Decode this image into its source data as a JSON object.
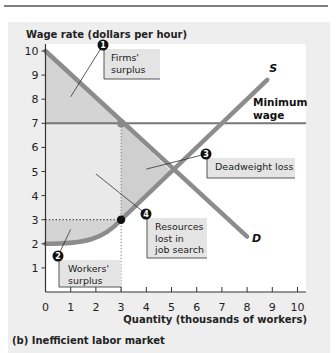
{
  "chart_data": {
    "type": "line",
    "panel_caption": "(b)  Inefficient labor market",
    "ylabel": "Wage rate (dollars per hour)",
    "xlabel": "Quantity (thousands of workers)",
    "xlim": [
      0,
      10
    ],
    "ylim": [
      0,
      10
    ],
    "x_ticks": [
      0,
      1,
      2,
      3,
      4,
      5,
      6,
      7,
      8,
      9,
      10
    ],
    "y_ticks": [
      1,
      2,
      3,
      4,
      5,
      6,
      7,
      8,
      9,
      10
    ],
    "highlight_x_tick": 3,
    "grid": false,
    "series": [
      {
        "name": "D",
        "label": "D",
        "kind": "demand",
        "points": [
          [
            0,
            10
          ],
          [
            8,
            2.3
          ]
        ]
      },
      {
        "name": "S",
        "label": "S",
        "kind": "supply",
        "points": [
          [
            0,
            2
          ],
          [
            1,
            2.05
          ],
          [
            2,
            2.4
          ],
          [
            3,
            3
          ],
          [
            5,
            5
          ],
          [
            8.8,
            8.8
          ]
        ]
      },
      {
        "name": "Minimum wage",
        "label": "Minimum\nwage",
        "kind": "horizontal",
        "y": 7,
        "x_range": [
          0,
          10.5
        ]
      }
    ],
    "points_of_interest": [
      {
        "name": "min-wage-demand",
        "x": 3,
        "y": 7,
        "color": "#8a8a8a"
      },
      {
        "name": "supply-at-3",
        "x": 3,
        "y": 3,
        "color": "#111111"
      },
      {
        "name": "equilibrium",
        "x": 5,
        "y": 5
      }
    ],
    "guides": [
      {
        "type": "vertical",
        "x": 3,
        "y_range": [
          0,
          7
        ]
      },
      {
        "type": "horizontal",
        "y": 3,
        "x_range": [
          0,
          3
        ]
      }
    ],
    "regions": [
      {
        "name": "firms-surplus",
        "polygon": [
          [
            0,
            10
          ],
          [
            3,
            7
          ],
          [
            0,
            7
          ]
        ]
      },
      {
        "name": "resources-lost-in-job-search",
        "polygon": [
          [
            0,
            7
          ],
          [
            3,
            7
          ],
          [
            3,
            3
          ],
          [
            0,
            3
          ]
        ]
      },
      {
        "name": "workers-surplus",
        "description": "area between w=3 and supply curve from x=0 to 3"
      },
      {
        "name": "deadweight-loss",
        "polygon": [
          [
            3,
            7
          ],
          [
            5,
            5
          ],
          [
            3,
            3
          ]
        ]
      }
    ],
    "annotations": [
      {
        "number": "1",
        "text": "Firms'\nsurplus",
        "target": [
          1,
          8.1
        ]
      },
      {
        "number": "2",
        "text": "Workers'\nsurplus",
        "target": [
          1,
          2.6
        ]
      },
      {
        "number": "3",
        "text": "Deadweight loss",
        "target": [
          4,
          5.1
        ]
      },
      {
        "number": "4",
        "text": "Resources\nlost in\njob search",
        "target": [
          2,
          4.9
        ]
      }
    ],
    "colors": {
      "panel_bg": "#eeeeee",
      "plot_bg": "#ffffff",
      "curve": "#8c8c8c",
      "min_wage_line": "#777777",
      "firms_surplus_fill": "#d4d4d4",
      "resources_fill": "#e9e9e9",
      "workers_surplus_fill": "#d4d4d4",
      "deadweight_fill": "#cfcfcf",
      "badge": "#111111",
      "label_box": "#e4e4e4"
    }
  }
}
